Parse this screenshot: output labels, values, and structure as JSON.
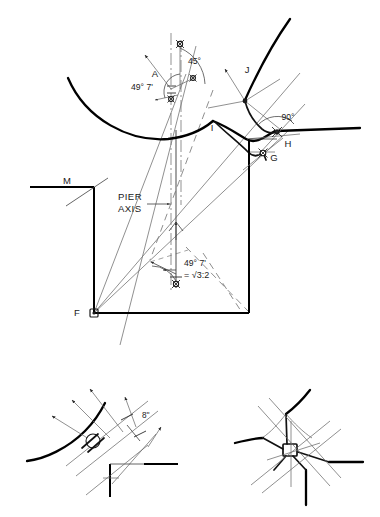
{
  "figure": {
    "title": "Pier axis geometric setting-out diagram",
    "background_color": "#ffffff",
    "ink_color": "#1a1a1a",
    "construction_line_color": "#6b6b6b"
  },
  "main_diagram": {
    "name": "main-setting-out-diagram",
    "point_labels": {
      "a": "A",
      "f": "F",
      "g": "G",
      "h": "H",
      "i": "I",
      "j": "J",
      "m": "M"
    },
    "annotations": {
      "angle_45": "45°",
      "angle_49_7_upper": "49° 7'",
      "angle_49_7_lower": "49° 7'",
      "ratio": "= √3:2",
      "angle_90": "90°",
      "pier_axis_line1": "PIER",
      "pier_axis_line2": "AXIS"
    }
  },
  "detail_left": {
    "name": "detail-rib-offsets",
    "annotations": {
      "dimension_8in": "8''"
    }
  },
  "detail_right": {
    "name": "detail-star-vault-boss",
    "annotations": {}
  }
}
